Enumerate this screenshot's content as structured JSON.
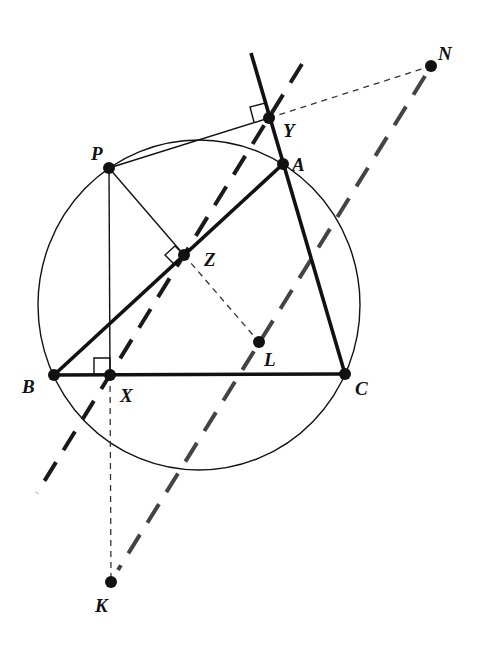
{
  "figure": {
    "colors": {
      "stroke": "#111111",
      "dashed_line_1": "#1a1a1a",
      "dashed_line_2": "#444444",
      "background": "#ffffff"
    },
    "points": [
      {
        "name": "A",
        "label": "A",
        "x": 283,
        "y": 164,
        "lx": 292,
        "ly": 171
      },
      {
        "name": "B",
        "label": "B",
        "x": 54,
        "y": 375,
        "lx": 22,
        "ly": 393
      },
      {
        "name": "C",
        "label": "C",
        "x": 345,
        "y": 374,
        "lx": 355,
        "ly": 395
      },
      {
        "name": "P",
        "label": "P",
        "x": 109,
        "y": 168,
        "lx": 91,
        "ly": 160
      },
      {
        "name": "X",
        "label": "X",
        "x": 110,
        "y": 375,
        "lx": 120,
        "ly": 402
      },
      {
        "name": "Y",
        "label": "Y",
        "x": 269,
        "y": 118,
        "lx": 283,
        "ly": 137
      },
      {
        "name": "Z",
        "label": "Z",
        "x": 184,
        "y": 255,
        "lx": 204,
        "ly": 266
      },
      {
        "name": "L",
        "label": "L",
        "x": 259,
        "y": 342,
        "lx": 264,
        "ly": 366
      },
      {
        "name": "N",
        "label": "N",
        "x": 431,
        "y": 66,
        "lx": 438,
        "ly": 60
      },
      {
        "name": "K",
        "label": "K",
        "x": 111,
        "y": 582,
        "lx": 95,
        "ly": 612
      }
    ],
    "circle": {
      "cx": 199,
      "cy": 305,
      "rx": 161,
      "ry": 165
    },
    "segments": {
      "thick": [
        {
          "name": "side-BC",
          "x1": 54,
          "y1": 375,
          "x2": 345,
          "y2": 374
        },
        {
          "name": "side-BA",
          "x1": 54,
          "y1": 375,
          "x2": 283,
          "y2": 164
        },
        {
          "name": "line-CA-extended",
          "x1": 345,
          "y1": 374,
          "x2": 251,
          "y2": 53
        }
      ],
      "thin": [
        {
          "name": "segment-PX",
          "x1": 109,
          "y1": 168,
          "x2": 110,
          "y2": 375
        },
        {
          "name": "segment-PZ",
          "x1": 109,
          "y1": 168,
          "x2": 184,
          "y2": 255
        },
        {
          "name": "segment-PY",
          "x1": 109,
          "y1": 168,
          "x2": 269,
          "y2": 118
        }
      ],
      "dashed_thin": [
        {
          "name": "segment-YN",
          "x1": 269,
          "y1": 118,
          "x2": 431,
          "y2": 66
        },
        {
          "name": "segment-ZL",
          "x1": 184,
          "y1": 255,
          "x2": 259,
          "y2": 342
        },
        {
          "name": "segment-XK",
          "x1": 110,
          "y1": 375,
          "x2": 111,
          "y2": 582
        }
      ],
      "dashed_thick": [
        {
          "name": "simson-line",
          "x1": 302,
          "y1": 64,
          "x2": 37,
          "y2": 493
        },
        {
          "name": "line-NK",
          "x1": 425,
          "y1": 76,
          "x2": 118,
          "y2": 570
        }
      ]
    },
    "right_angles": [
      {
        "name": "right-angle-Y",
        "points": "269,118 265,103 250,107 254,122"
      },
      {
        "name": "right-angle-Z",
        "points": "184,255 175,246 165,255 174,264"
      },
      {
        "name": "right-angle-X",
        "points": "110,375 110,358 94,358 94,375"
      }
    ]
  }
}
